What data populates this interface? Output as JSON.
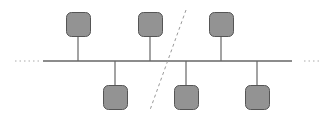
{
  "diagram": {
    "type": "bus-network-topology",
    "colors": {
      "background": "#ffffff",
      "node_fill": "#939393",
      "node_stroke": "#555555",
      "line": "#666666",
      "dashed": "#999999",
      "dotted": "#aaaaaa"
    },
    "bus": {
      "x1": 43,
      "x2": 292,
      "y": 61
    },
    "bus_extensions": [
      {
        "side": "left",
        "x1": 15,
        "x2": 40,
        "y": 61
      },
      {
        "side": "right",
        "x1": 304,
        "x2": 320,
        "y": 61
      }
    ],
    "nodes": [
      {
        "id": "top-1",
        "position": "above",
        "x": 66,
        "y": 12,
        "w": 24,
        "h": 24
      },
      {
        "id": "top-2",
        "position": "above",
        "x": 138,
        "y": 12,
        "w": 24,
        "h": 24
      },
      {
        "id": "top-3",
        "position": "above",
        "x": 209,
        "y": 12,
        "w": 24,
        "h": 24
      },
      {
        "id": "bottom-1",
        "position": "below",
        "x": 103,
        "y": 85,
        "w": 24,
        "h": 24
      },
      {
        "id": "bottom-2",
        "position": "below",
        "x": 174,
        "y": 85,
        "w": 24,
        "h": 24
      },
      {
        "id": "bottom-3",
        "position": "below",
        "x": 245,
        "y": 85,
        "w": 24,
        "h": 24
      }
    ],
    "break_line": {
      "x1": 186,
      "y1": 10,
      "x2": 150,
      "y2": 110
    }
  }
}
